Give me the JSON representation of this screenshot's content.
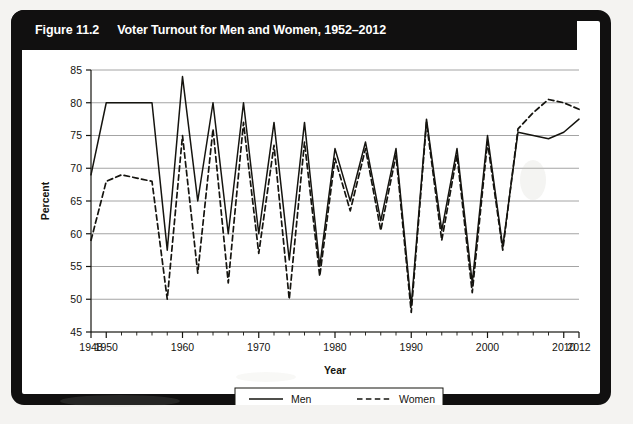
{
  "figure": {
    "number": "Figure 11.2",
    "title": "Voter Turnout for Men and Women, 1952–2012"
  },
  "axes": {
    "y_label": "Percent",
    "x_label": "Year",
    "y_ticks": [
      45,
      50,
      55,
      60,
      65,
      70,
      75,
      80,
      85
    ],
    "x_ticks_major": [
      1948,
      1950,
      1960,
      1970,
      1980,
      1990,
      2000,
      2010,
      2012
    ],
    "x_tick_step_minor": 2
  },
  "legend": {
    "items": [
      {
        "label": "Men",
        "style": "solid"
      },
      {
        "label": "Women",
        "style": "dashed"
      }
    ]
  },
  "chart_data": {
    "type": "line",
    "title": "Voter Turnout for Men and Women, 1952–2012",
    "xlabel": "Year",
    "ylabel": "Percent",
    "xlim": [
      1948,
      2012
    ],
    "ylim": [
      45,
      85
    ],
    "grid": true,
    "legend_position": "bottom",
    "x": [
      1948,
      1950,
      1952,
      1954,
      1956,
      1958,
      1960,
      1962,
      1964,
      1966,
      1968,
      1970,
      1972,
      1974,
      1976,
      1978,
      1980,
      1982,
      1984,
      1986,
      1988,
      1990,
      1992,
      1994,
      1996,
      1998,
      2000,
      2002,
      2004,
      2006,
      2008,
      2010,
      2012
    ],
    "series": [
      {
        "name": "Men",
        "style": "solid",
        "values": [
          69,
          80,
          80,
          80,
          80,
          57.5,
          84,
          65,
          80,
          60,
          80,
          60,
          77,
          56,
          77,
          55,
          73,
          65,
          74,
          62,
          73,
          49,
          77.5,
          60.5,
          73,
          52.5,
          75,
          58,
          75.5,
          75,
          74.5,
          75.5,
          77.5
        ]
      },
      {
        "name": "Women",
        "style": "dashed",
        "values": [
          59,
          68,
          69,
          68.5,
          68,
          50,
          75,
          54,
          76,
          52.5,
          77,
          57,
          73.5,
          50,
          74,
          53.5,
          71.5,
          63.5,
          73,
          60.5,
          72,
          48,
          77,
          59,
          72,
          51,
          74,
          57.5,
          76,
          78.5,
          80.5,
          80,
          79
        ]
      }
    ]
  }
}
